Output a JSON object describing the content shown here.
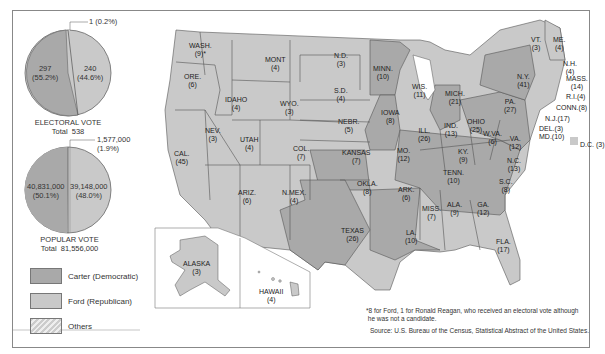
{
  "colors": {
    "carter": "#a9a9a9",
    "ford": "#c9c9c9",
    "border": "#555555"
  },
  "electoral": {
    "slices": [
      {
        "name": "Carter",
        "value": "297",
        "pct": "(55.2%)"
      },
      {
        "name": "Ford",
        "value": "240",
        "pct": "(44.6%)"
      },
      {
        "name": "Others",
        "value": "1",
        "pct": "(0.2%)",
        "label": "1 (0.2%)"
      }
    ],
    "title": "ELECTORAL VOTE",
    "total": "Total  538"
  },
  "popular": {
    "slices": [
      {
        "name": "Carter",
        "value": "40,831,000",
        "pct": "(50.1%)"
      },
      {
        "name": "Ford",
        "value": "39,148,000",
        "pct": "(48.0%)"
      },
      {
        "name": "Others",
        "value": "1,577,000",
        "pct": "(1.9%)"
      }
    ],
    "title": "POPULAR VOTE",
    "total": "Total  81,556,000"
  },
  "legend": [
    {
      "label": "Carter (Democratic)"
    },
    {
      "label": "Ford (Republican)"
    },
    {
      "label": "Others"
    }
  ],
  "states": {
    "wash": "WASH.\n(9)*",
    "ore": "ORE.\n(6)",
    "cal": "CAL.\n(45)",
    "nev": "NEV.\n(3)",
    "idaho": "IDAHO\n(4)",
    "mont": "MONT\n(4)",
    "wyo": "WYO.\n(3)",
    "utah": "UTAH\n(4)",
    "col": "COL.\n(7)",
    "ariz": "ARIZ.\n(6)",
    "nmex": "N.MEX.\n(4)",
    "nd": "N.D.\n(3)",
    "sd": "S.D.\n(4)",
    "nebr": "NEBR.\n(5)",
    "kansas": "KANSAS\n(7)",
    "okla": "OKLA.\n(8)",
    "texas": "TEXAS\n(26)",
    "minn": "MINN.\n(10)",
    "iowa": "IOWA\n(8)",
    "mo": "MO.\n(12)",
    "ark": "ARK.\n(6)",
    "la": "LA.\n(10)",
    "wis": "WIS.\n(11)",
    "ill": "ILL.\n(26)",
    "mich": "MICH.\n(21)",
    "ind": "IND.\n(13)",
    "ohio": "OHIO\n(25)",
    "ky": "KY.\n(9)",
    "tenn": "TENN.\n(10)",
    "miss": "MISS.\n(7)",
    "ala": "ALA.\n(9)",
    "ga": "GA.\n(12)",
    "fla": "FLA.\n(17)",
    "sc": "S.C.\n(8)",
    "nc": "N.C.\n(13)",
    "va": "VA.\n(12)",
    "wva": "W.VA.\n(6)",
    "pa": "PA.\n(27)",
    "ny": "N.Y.\n(41)",
    "vt": "VT.\n(3)",
    "me": "ME.\n(4)",
    "nh": "N.H.\n(4)",
    "mass": "MASS.\n(14)",
    "ri": "R.I.(4)",
    "conn": "CONN.(8)",
    "nj": "N.J.(17)",
    "del": "DEL.(3)",
    "md": "MD.(10)",
    "dc": "D.C. (3)",
    "alaska": "ALASKA\n(3)",
    "hawaii": "HAWAII\n(4)"
  },
  "footnote": "*8 for Ford, 1 for Ronald Reagan, who received an electoral vote although\n he was not a candidate.",
  "source": "Source: U.S. Bureau of the Census, Statistical Abstract of the United States."
}
